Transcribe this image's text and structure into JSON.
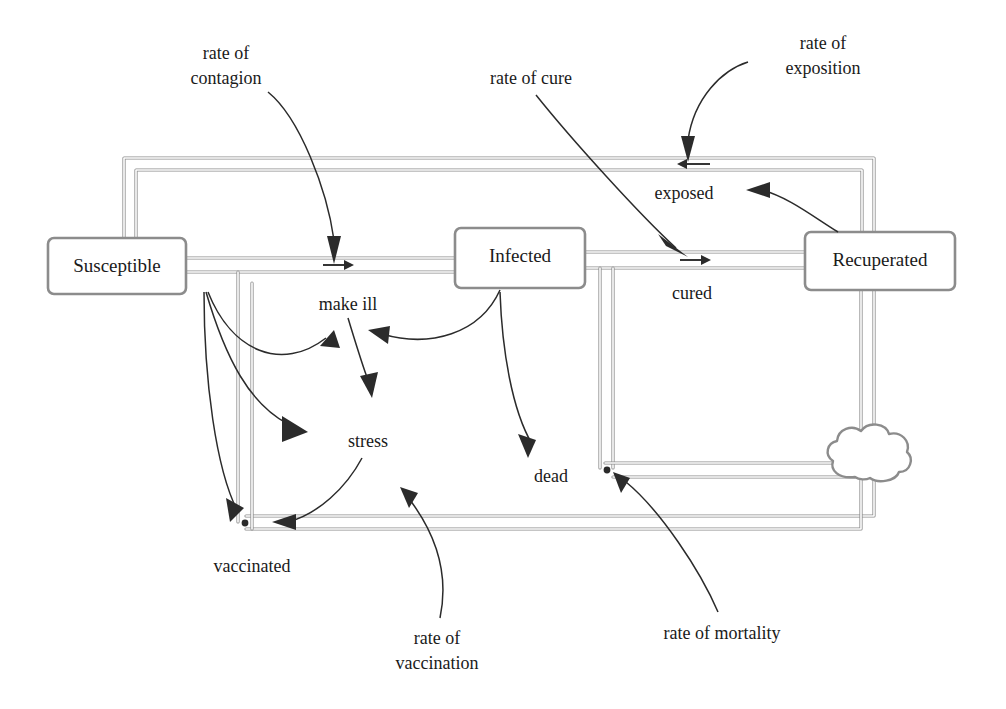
{
  "diagram": {
    "type": "system-dynamics-stock-flow",
    "colors": {
      "pipe": "#8c8c8c",
      "link": "#2b2b2b",
      "text": "#1a1a1a",
      "background": "#ffffff"
    }
  },
  "stocks": [
    {
      "id": "susceptible",
      "label": "Susceptible"
    },
    {
      "id": "infected",
      "label": "Infected"
    },
    {
      "id": "recuperated",
      "label": "Recuperated"
    }
  ],
  "flows": [
    {
      "id": "make-ill",
      "label": "make ill"
    },
    {
      "id": "exposed",
      "label": "exposed"
    },
    {
      "id": "cured",
      "label": "cured"
    },
    {
      "id": "stress",
      "label": "stress"
    },
    {
      "id": "dead",
      "label": "dead"
    },
    {
      "id": "vaccinated",
      "label": "vaccinated"
    }
  ],
  "parameters": [
    {
      "id": "rate-of-contagion",
      "line1": "rate of",
      "line2": "contagion"
    },
    {
      "id": "rate-of-cure",
      "line1": "rate of cure",
      "line2": ""
    },
    {
      "id": "rate-of-exposition",
      "line1": "rate of",
      "line2": "exposition"
    },
    {
      "id": "rate-of-vaccination",
      "line1": "rate of",
      "line2": "vaccination"
    },
    {
      "id": "rate-of-mortality",
      "line1": "rate of mortality",
      "line2": ""
    }
  ],
  "sinks": [
    {
      "id": "cloud-sink",
      "label": "cloud"
    }
  ]
}
